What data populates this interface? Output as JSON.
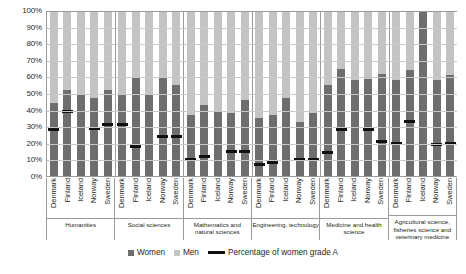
{
  "chart_data": {
    "type": "bar",
    "title": "",
    "subtitle": "",
    "xlabel": "",
    "ylabel": "",
    "ylim": [
      0,
      100
    ],
    "grid": true,
    "legend_position": "bottom",
    "y_ticks": [
      "100%",
      "90%",
      "80%",
      "70%",
      "60%",
      "50%",
      "40%",
      "30%",
      "20%",
      "10%",
      "0%"
    ],
    "stacked": true,
    "countries": [
      "Denmark",
      "Finland",
      "Iceland",
      "Norway",
      "Sweden"
    ],
    "series": [
      {
        "name": "Women",
        "color": "#6e6e6e"
      },
      {
        "name": "Men",
        "color": "#c4c4c4"
      },
      {
        "name": "Percentage of women grade A",
        "color": "#101010",
        "marker": "line"
      }
    ],
    "groups": [
      {
        "label": "Humanities",
        "bars": [
          {
            "country": "Denmark",
            "women": 44,
            "men": 56,
            "grade_a": 28
          },
          {
            "country": "Finland",
            "women": 52,
            "men": 48,
            "grade_a": 39
          },
          {
            "country": "Iceland",
            "women": 50,
            "men": 50,
            "grade_a": null
          },
          {
            "country": "Norway",
            "women": 47,
            "men": 53,
            "grade_a": 29
          },
          {
            "country": "Sweden",
            "women": 52,
            "men": 48,
            "grade_a": 31
          }
        ]
      },
      {
        "label": "Social sciences",
        "bars": [
          {
            "country": "Denmark",
            "women": 50,
            "men": 50,
            "grade_a": 31
          },
          {
            "country": "Finland",
            "women": 60,
            "men": 40,
            "grade_a": 18
          },
          {
            "country": "Iceland",
            "women": 50,
            "men": 50,
            "grade_a": null
          },
          {
            "country": "Norway",
            "women": 60,
            "men": 40,
            "grade_a": 24
          },
          {
            "country": "Sweden",
            "women": 55,
            "men": 45,
            "grade_a": 24
          }
        ]
      },
      {
        "label": "Mathematics and natural sciences",
        "bars": [
          {
            "country": "Denmark",
            "women": 37,
            "men": 63,
            "grade_a": 10
          },
          {
            "country": "Finland",
            "women": 43,
            "men": 57,
            "grade_a": 12
          },
          {
            "country": "Iceland",
            "women": 39,
            "men": 61,
            "grade_a": null
          },
          {
            "country": "Norway",
            "women": 38,
            "men": 62,
            "grade_a": 15
          },
          {
            "country": "Sweden",
            "women": 46,
            "men": 54,
            "grade_a": 15
          }
        ]
      },
      {
        "label": "Engineering, technology",
        "bars": [
          {
            "country": "Denmark",
            "women": 35,
            "men": 65,
            "grade_a": 7
          },
          {
            "country": "Finland",
            "women": 37,
            "men": 63,
            "grade_a": 8
          },
          {
            "country": "Iceland",
            "women": 47,
            "men": 53,
            "grade_a": null
          },
          {
            "country": "Norway",
            "women": 33,
            "men": 67,
            "grade_a": 10
          },
          {
            "country": "Sweden",
            "women": 38,
            "men": 62,
            "grade_a": 10
          }
        ]
      },
      {
        "label": "Medicine and health science",
        "bars": [
          {
            "country": "Denmark",
            "women": 55,
            "men": 45,
            "grade_a": 14
          },
          {
            "country": "Finland",
            "women": 65,
            "men": 35,
            "grade_a": 28
          },
          {
            "country": "Iceland",
            "women": 58,
            "men": 42,
            "grade_a": null
          },
          {
            "country": "Norway",
            "women": 59,
            "men": 41,
            "grade_a": 28
          },
          {
            "country": "Sweden",
            "women": 62,
            "men": 38,
            "grade_a": 21
          }
        ]
      },
      {
        "label": "Agricultural science, fisheries science and veterinary medicine",
        "bars": [
          {
            "country": "Denmark",
            "women": 58,
            "men": 42,
            "grade_a": 20
          },
          {
            "country": "Finland",
            "women": 64,
            "men": 36,
            "grade_a": 33
          },
          {
            "country": "Iceland",
            "women": 100,
            "men": 0,
            "grade_a": null
          },
          {
            "country": "Norway",
            "women": 58,
            "men": 42,
            "grade_a": 19
          },
          {
            "country": "Sweden",
            "women": 61,
            "men": 39,
            "grade_a": 20
          }
        ]
      }
    ]
  },
  "legend": {
    "women_label": "Women",
    "men_label": "Men",
    "line_label": "Percentage of women grade A"
  }
}
